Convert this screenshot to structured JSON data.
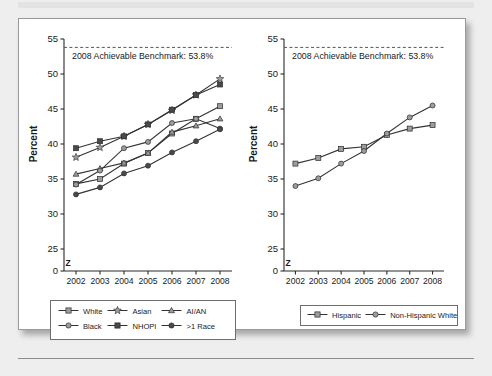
{
  "figure": {
    "background": "#eeeeee",
    "panel_background": "#ffffff",
    "axis_color": "#2b2b2b"
  },
  "colors": {
    "light_gray_marker": "#9d9d9d",
    "dark_gray_marker": "#4a4a4a",
    "line": "#333333",
    "benchmark_line": "#555555",
    "text": "#1a1a1a"
  },
  "chart_data": [
    {
      "type": "line",
      "id": "left",
      "title": "",
      "xlabel": "",
      "ylabel": "Percent",
      "categories": [
        "2002",
        "2003",
        "2004",
        "2005",
        "2006",
        "2007",
        "2008"
      ],
      "ylim": [
        25,
        55
      ],
      "yticks": [
        "0",
        "25",
        "30",
        "35",
        "40",
        "45",
        "50",
        "55"
      ],
      "axis_break": "Z",
      "grid": false,
      "legend_position": "below",
      "annotations": [
        {
          "text": "2008 Achievable Benchmark: 53.8%",
          "value": 53.8
        }
      ],
      "benchmark": 53.8,
      "series": [
        {
          "name": "White",
          "marker": "square",
          "fill": "light",
          "values": [
            34.3,
            35.0,
            37.2,
            38.7,
            41.5,
            43.6,
            45.4
          ]
        },
        {
          "name": "Asian",
          "marker": "star",
          "fill": "light",
          "values": [
            38.1,
            39.5,
            41.1,
            42.8,
            44.8,
            47.0,
            49.3
          ]
        },
        {
          "name": "AI/AN",
          "marker": "triangle",
          "fill": "light",
          "values": [
            35.7,
            36.5,
            37.3,
            38.7,
            41.7,
            42.6,
            43.6
          ]
        },
        {
          "name": "Black",
          "marker": "circle",
          "fill": "light",
          "values": [
            34.2,
            36.2,
            39.4,
            40.3,
            43.0,
            43.6,
            42.2
          ]
        },
        {
          "name": "NHOPI",
          "marker": "square",
          "fill": "dark",
          "values": [
            39.4,
            40.4,
            41.1,
            42.8,
            44.9,
            47.0,
            48.5
          ]
        },
        {
          "name": ">1 Race",
          "marker": "circle",
          "fill": "dark",
          "values": [
            32.8,
            33.8,
            35.8,
            36.9,
            38.8,
            40.4,
            42.1
          ]
        }
      ]
    },
    {
      "type": "line",
      "id": "right",
      "title": "",
      "xlabel": "",
      "ylabel": "Percent",
      "categories": [
        "2002",
        "2003",
        "2004",
        "2005",
        "2006",
        "2007",
        "2008"
      ],
      "ylim": [
        25,
        55
      ],
      "yticks": [
        "0",
        "25",
        "30",
        "35",
        "40",
        "45",
        "50",
        "55"
      ],
      "axis_break": "Z",
      "grid": false,
      "legend_position": "below",
      "annotations": [
        {
          "text": "2008 Achievable Benchmark: 53.8%",
          "value": 53.8
        }
      ],
      "benchmark": 53.8,
      "series": [
        {
          "name": "Hispanic",
          "marker": "square",
          "fill": "light",
          "values": [
            37.2,
            38.0,
            39.3,
            39.6,
            41.3,
            42.2,
            42.7
          ]
        },
        {
          "name": "Non-Hispanic White",
          "marker": "circle",
          "fill": "light",
          "values": [
            34.0,
            35.1,
            37.2,
            39.0,
            41.5,
            43.8,
            45.5
          ]
        }
      ]
    }
  ],
  "left_chart": {
    "ylabel": "Percent",
    "benchmark_text": "2008 Achievable Benchmark: 53.8%",
    "break_symbol": "Z",
    "legend": [
      {
        "label": "White",
        "marker": "square",
        "fill": "light"
      },
      {
        "label": "Asian",
        "marker": "star",
        "fill": "light"
      },
      {
        "label": "AI/AN",
        "marker": "triangle",
        "fill": "light"
      },
      {
        "label": "Black",
        "marker": "circle",
        "fill": "light"
      },
      {
        "label": "NHOPI",
        "marker": "square",
        "fill": "dark"
      },
      {
        "label": ">1 Race",
        "marker": "circle",
        "fill": "dark"
      }
    ]
  },
  "right_chart": {
    "ylabel": "Percent",
    "benchmark_text": "2008 Achievable Benchmark: 53.8%",
    "break_symbol": "Z",
    "legend": [
      {
        "label": "Hispanic",
        "marker": "square",
        "fill": "light"
      },
      {
        "label": "Non-Hispanic White",
        "marker": "circle",
        "fill": "light"
      }
    ]
  }
}
